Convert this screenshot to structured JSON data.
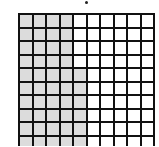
{
  "diagram": {
    "type": "hundred-grid",
    "columns": 10,
    "rows_visible": 10,
    "shaded_per_row": [
      4,
      4,
      4,
      4,
      5,
      5,
      5,
      5,
      5,
      5
    ],
    "colors": {
      "shaded": "#dcdcdc",
      "unshaded": "#ffffff",
      "gridline": "#111111"
    }
  }
}
